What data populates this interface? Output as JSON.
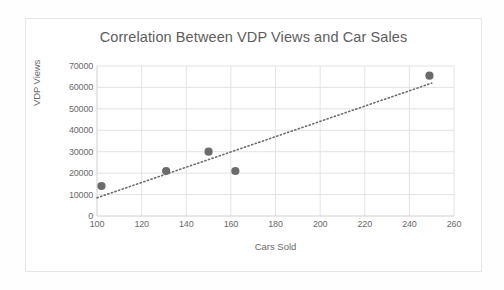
{
  "chart_data": {
    "type": "scatter",
    "title": "Correlation Between VDP Views and Car Sales",
    "xlabel": "Cars Sold",
    "ylabel": "VDP Views",
    "xlim": [
      100,
      260
    ],
    "ylim": [
      0,
      70000
    ],
    "xticks": [
      100,
      120,
      140,
      160,
      180,
      200,
      220,
      240,
      260
    ],
    "yticks": [
      0,
      10000,
      20000,
      30000,
      40000,
      50000,
      60000,
      70000
    ],
    "grid": true,
    "legend": null,
    "series": [
      {
        "name": "VDP Views",
        "marker": "circle",
        "color": "#6b6b6b",
        "points": [
          {
            "x": 102,
            "y": 14000
          },
          {
            "x": 131,
            "y": 21000
          },
          {
            "x": 150,
            "y": 30000
          },
          {
            "x": 162,
            "y": 21000
          },
          {
            "x": 249,
            "y": 65500
          }
        ]
      }
    ],
    "trendline": {
      "style": "dotted",
      "color": "#6b6b6b",
      "x_start": 100,
      "y_start": 8500,
      "x_end": 250,
      "y_end": 62000
    },
    "colors": {
      "marker": "#6b6b6b",
      "trendline": "#6b6b6b",
      "grid": "#e3e3e3",
      "axis": "#d0d0d0",
      "title_text": "#5d5d5d",
      "tick_text": "#6a6a6a"
    }
  }
}
